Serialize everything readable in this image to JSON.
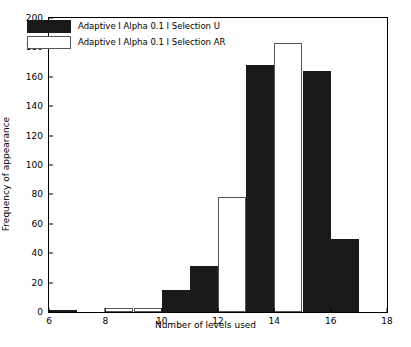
{
  "chart_data": {
    "type": "bar",
    "title": "",
    "xlabel": "Number of levels used",
    "ylabel": "Frequency of appearance",
    "xlim": [
      6,
      18
    ],
    "ylim": [
      0,
      200
    ],
    "xticks": [
      6,
      8,
      10,
      12,
      14,
      16,
      18
    ],
    "yticks": [
      0,
      20,
      40,
      60,
      80,
      100,
      120,
      140,
      160,
      180,
      200
    ],
    "grid": false,
    "legend_position": "upper left",
    "bin_edges": [
      6,
      7,
      8,
      9,
      10,
      11,
      12,
      13,
      14,
      15,
      16,
      17,
      18
    ],
    "categories": [
      "6-7",
      "7-8",
      "8-9",
      "9-10",
      "10-11",
      "11-12",
      "12-13",
      "13-14",
      "14-15",
      "15-16",
      "16-17",
      "17-18"
    ],
    "series": [
      {
        "name": "Adaptive I Alpha 0.1 I Selection U",
        "color": "#1a1a1a",
        "style": "filled",
        "values": [
          1,
          0,
          0,
          0,
          15,
          31,
          0,
          168,
          0,
          164,
          50,
          0
        ]
      },
      {
        "name": "Adaptive I Alpha 0.1 I Selection AR",
        "color": "#ffffff",
        "style": "outline",
        "values": [
          0,
          0,
          3,
          3,
          1,
          8,
          78,
          134,
          183,
          60,
          4,
          0
        ]
      }
    ]
  },
  "legend": {
    "entries": [
      {
        "label": "Adaptive I Alpha 0.1 I Selection U",
        "swatch": "u"
      },
      {
        "label": "Adaptive I Alpha 0.1 I Selection AR",
        "swatch": "ar"
      }
    ]
  }
}
